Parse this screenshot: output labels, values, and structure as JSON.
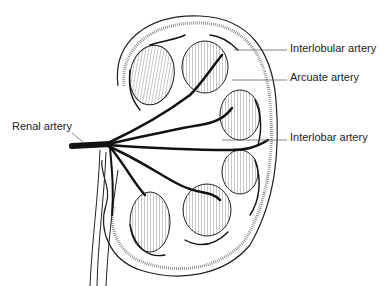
{
  "diagram": {
    "labels": [
      {
        "id": "interlobular",
        "text": "Interlobular artery",
        "x": 290,
        "y": 42
      },
      {
        "id": "arcuate",
        "text": "Arcuate artery",
        "x": 290,
        "y": 71
      },
      {
        "id": "interlobar",
        "text": "Interlobar artery",
        "x": 290,
        "y": 131
      },
      {
        "id": "renal",
        "text": "Renal artery",
        "x": 12,
        "y": 120
      }
    ],
    "colors": {
      "ink": "#1a1a1a",
      "background": "#ffffff",
      "leader": "#666666"
    }
  }
}
